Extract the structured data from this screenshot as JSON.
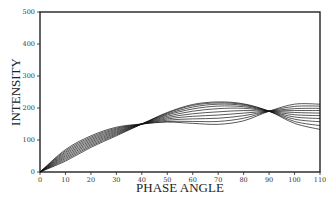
{
  "chart_data": {
    "type": "line",
    "title": "",
    "xlabel": "PHASE ANGLE",
    "ylabel": "INTENSITY",
    "xlim": [
      0,
      110
    ],
    "ylim": [
      0,
      500
    ],
    "xticks": [
      0,
      10,
      20,
      30,
      40,
      50,
      60,
      70,
      80,
      90,
      100,
      110
    ],
    "yticks": [
      0,
      100,
      200,
      300,
      400,
      500
    ],
    "grid": false,
    "legend": null,
    "line_color": "#111111",
    "x": [
      0,
      10,
      20,
      30,
      40,
      50,
      60,
      70,
      80,
      90,
      100,
      110
    ],
    "series": [
      {
        "name": "curve-1",
        "values": [
          0,
          70,
          113,
          140,
          150,
          156,
          152,
          149,
          160,
          190,
          212,
          212
        ]
      },
      {
        "name": "curve-2",
        "values": [
          0,
          66,
          109,
          137,
          150,
          158,
          158,
          158,
          168,
          190,
          205,
          206
        ]
      },
      {
        "name": "curve-3",
        "values": [
          0,
          62,
          105,
          134,
          150,
          162,
          166,
          168,
          176,
          190,
          198,
          199
        ]
      },
      {
        "name": "curve-4",
        "values": [
          0,
          58,
          101,
          131,
          150,
          166,
          174,
          178,
          184,
          190,
          192,
          192
        ]
      },
      {
        "name": "curve-5",
        "values": [
          0,
          54,
          97,
          128,
          150,
          170,
          182,
          188,
          192,
          190,
          186,
          184
        ]
      },
      {
        "name": "curve-6",
        "values": [
          0,
          50,
          93,
          125,
          150,
          174,
          190,
          198,
          199,
          190,
          179,
          176
        ]
      },
      {
        "name": "curve-7",
        "values": [
          0,
          46,
          89,
          122,
          150,
          178,
          197,
          206,
          204,
          190,
          172,
          167
        ]
      },
      {
        "name": "curve-8",
        "values": [
          0,
          42,
          85,
          119,
          150,
          181,
          203,
          212,
          208,
          190,
          165,
          157
        ]
      },
      {
        "name": "curve-9",
        "values": [
          0,
          38,
          81,
          116,
          150,
          184,
          208,
          216,
          211,
          190,
          158,
          145
        ]
      },
      {
        "name": "curve-10",
        "values": [
          0,
          34,
          77,
          113,
          150,
          186,
          211,
          219,
          213,
          190,
          152,
          133
        ]
      }
    ],
    "annotations": []
  }
}
